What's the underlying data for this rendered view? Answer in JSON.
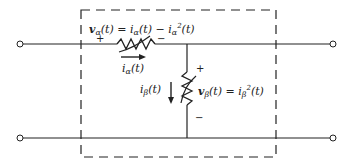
{
  "diagram": {
    "type": "circuit",
    "colors": {
      "line": "#222222",
      "background": "#ffffff"
    },
    "series_element": {
      "name": "alpha",
      "voltage_label_v": "v",
      "voltage_label_sub": "α",
      "voltage_label_rest": "(t) = ",
      "eq_i1": "i",
      "eq_i1_sub": "α",
      "eq_i1_rest": "(t) − ",
      "eq_i2": "i",
      "eq_i2_sub": "α",
      "eq_i2_sup": "2",
      "eq_i2_rest": "(t)",
      "plus": "+",
      "minus": "−",
      "current_label_i": "i",
      "current_label_sub": "α",
      "current_label_rest": "(t)"
    },
    "shunt_element": {
      "name": "beta",
      "voltage_label_v": "v",
      "voltage_label_sub": "β",
      "voltage_label_rest": "(t) = ",
      "eq_i": "i",
      "eq_i_sub": "β",
      "eq_i_sup": "2",
      "eq_i_rest": "(t)",
      "plus": "+",
      "minus": "−",
      "current_label_i": "i",
      "current_label_sub": "β",
      "current_label_rest": "(t)"
    },
    "terminals": [
      "left-top",
      "left-bottom",
      "right-top",
      "right-bottom"
    ]
  }
}
